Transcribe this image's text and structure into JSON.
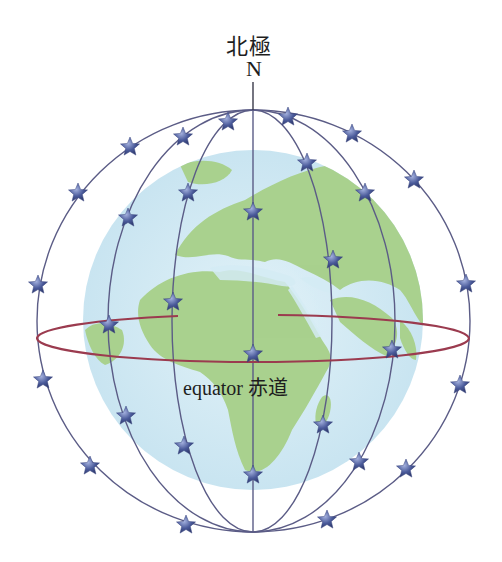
{
  "pole": {
    "label_zh": "北極",
    "label_en": "N"
  },
  "equator": {
    "label": "equator 赤道"
  },
  "colors": {
    "ocean": "#d4ebf4",
    "land": "#a9d18e",
    "orbit": "#5b5c86",
    "equator": "#9b3b4f",
    "star": "#4a5a9a",
    "text": "#1e1e1e"
  },
  "globe": {
    "cx": 253,
    "cy": 320,
    "r": 170
  },
  "orbits": {
    "cx": 253,
    "top_y": 110,
    "bottom_y": 532,
    "equator_y": 340,
    "meridian_rx": [
      216,
      145,
      81,
      0,
      79,
      142,
      217
    ]
  },
  "equator_ring": {
    "cx": 253,
    "cy": 338,
    "rx": 216,
    "ry": 24
  },
  "satellites": [
    [
      228,
      122
    ],
    [
      288,
      117
    ],
    [
      183,
      137
    ],
    [
      352,
      134
    ],
    [
      130,
      147
    ],
    [
      414,
      180
    ],
    [
      78,
      193
    ],
    [
      307,
      163
    ],
    [
      365,
      193
    ],
    [
      188,
      193
    ],
    [
      253,
      212
    ],
    [
      128,
      218
    ],
    [
      333,
      260
    ],
    [
      38,
      285
    ],
    [
      466,
      284
    ],
    [
      173,
      302
    ],
    [
      109,
      325
    ],
    [
      392,
      350
    ],
    [
      253,
      354
    ],
    [
      43,
      380
    ],
    [
      460,
      385
    ],
    [
      126,
      416
    ],
    [
      323,
      425
    ],
    [
      184,
      446
    ],
    [
      253,
      475
    ],
    [
      90,
      466
    ],
    [
      359,
      462
    ],
    [
      406,
      469
    ],
    [
      186,
      525
    ],
    [
      327,
      520
    ]
  ]
}
